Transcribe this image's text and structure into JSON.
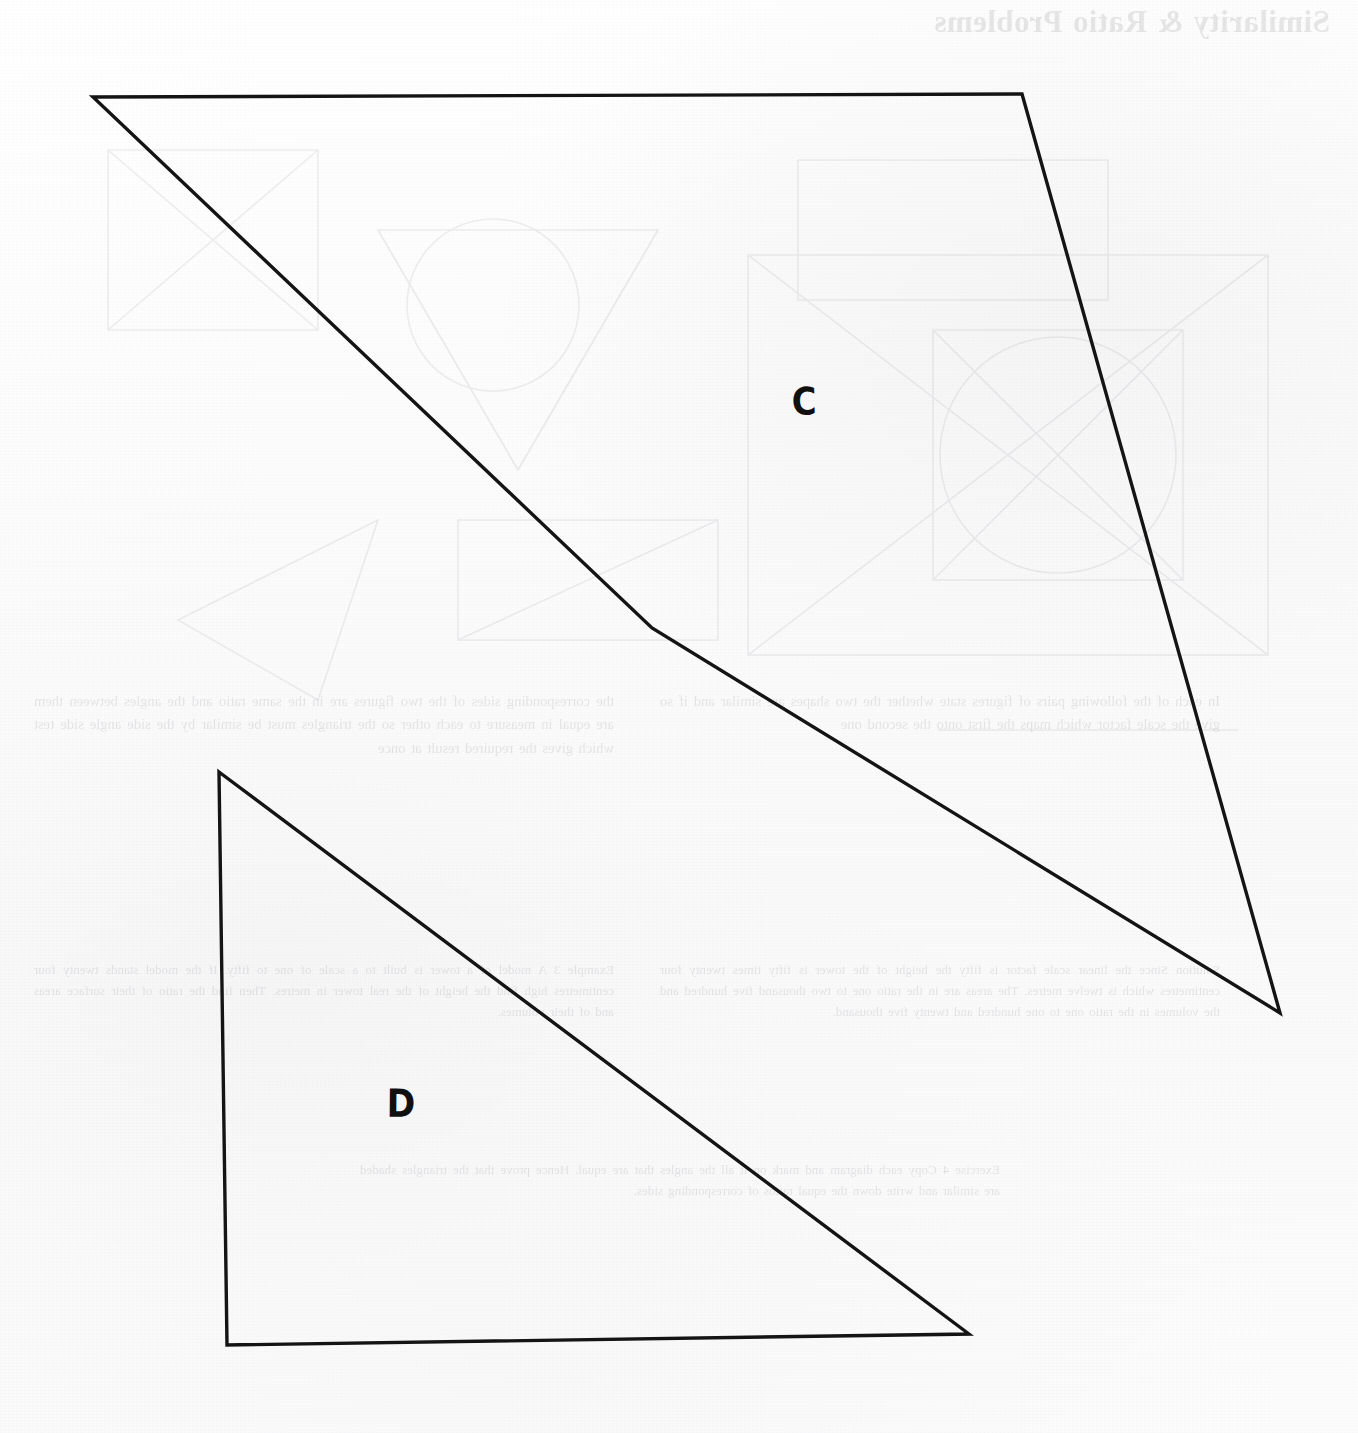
{
  "page": {
    "width": 1358,
    "height": 1433,
    "background_color": "#fcfcfc",
    "ink_color": "#141414",
    "medium": "scanned-textbook-page"
  },
  "figures": [
    {
      "id": "shape-c",
      "label": "C",
      "label_position": {
        "x": 791,
        "y": 384
      },
      "kind": "quadrilateral",
      "vertices": [
        {
          "x": 93,
          "y": 97
        },
        {
          "x": 1022,
          "y": 94
        },
        {
          "x": 1280,
          "y": 1013
        },
        {
          "x": 652,
          "y": 628
        }
      ],
      "closed": true
    },
    {
      "id": "shape-d",
      "label": "D",
      "label_position": {
        "x": 386,
        "y": 1086
      },
      "kind": "right-triangle",
      "vertices": [
        {
          "x": 219,
          "y": 772
        },
        {
          "x": 969,
          "y": 1334
        },
        {
          "x": 227,
          "y": 1345
        }
      ],
      "closed": true
    }
  ],
  "labels": {
    "c": "C",
    "d": "D"
  },
  "bleed_through": {
    "note": "Mirrored text showing through from the reverse side of the page; rendered faint and horizontally flipped.",
    "title": "Similarity & Ratio Problems",
    "blocks": [
      {
        "id": "verso-header",
        "text": "Similarity & Ratio Problems"
      },
      {
        "id": "verso-col-left-upper",
        "text": "the corresponding sides of the two figures are in the same ratio and the angles between them are equal in measure to each other so the triangles must be similar by the side angle side test which gives the required result at once"
      },
      {
        "id": "verso-col-right-upper",
        "text": "In each of the following pairs of figures state whether the two shapes are similar and if so give the scale factor which maps the first onto the second one"
      },
      {
        "id": "verso-col-left-lower",
        "text": "Example 3 A model of a tower is built to a scale of one to fifty. If the model stands twenty four centimetres high find the height of the real tower in metres. Then find the ratio of their surface areas and of their volumes."
      },
      {
        "id": "verso-col-right-lower",
        "text": "Solution Since the linear scale factor is fifty the height of the tower is fifty times twenty four centimetres which is twelve metres. The areas are in the ratio one to two thousand five hundred and the volumes in the ratio one to one hundred and twenty five thousand."
      },
      {
        "id": "verso-col-mid-lower",
        "text": "Exercise 4 Copy each diagram and mark on it all the angles that are equal. Hence prove that the triangles shaded are similar and write down the equal ratios of corresponding sides."
      }
    ]
  }
}
